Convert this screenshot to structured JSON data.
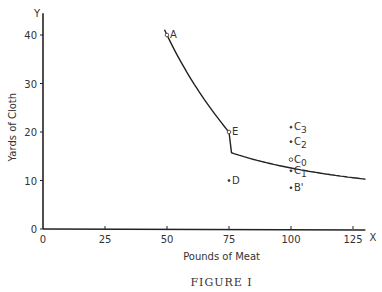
{
  "chart_data": {
    "type": "line",
    "title": "",
    "caption": "FIGURE I",
    "xlabel": "Pounds of Meat",
    "ylabel": "Yards of Cloth",
    "x_axis_letter": "X",
    "y_axis_letter": "Y",
    "xlim": [
      0,
      130
    ],
    "ylim": [
      0,
      44
    ],
    "x_ticks": [
      0,
      25,
      50,
      75,
      100,
      125
    ],
    "y_ticks": [
      0,
      10,
      20,
      30,
      40
    ],
    "grid": false,
    "series": [
      {
        "name": "indifference curve",
        "x": [
          49,
          50,
          60,
          75,
          90,
          100,
          115,
          130
        ],
        "y": [
          43.5,
          40,
          29,
          20,
          16,
          14.3,
          12.8,
          11.8
        ]
      }
    ],
    "points": [
      {
        "label": "A",
        "x": 50,
        "y": 40
      },
      {
        "label": "E",
        "x": 75,
        "y": 20
      },
      {
        "label": "C3",
        "x": 100,
        "y": 21
      },
      {
        "label": "C2",
        "x": 100,
        "y": 18
      },
      {
        "label": "C0",
        "x": 100,
        "y": 14.3
      },
      {
        "label": "C1",
        "x": 100,
        "y": 12
      },
      {
        "label": "D",
        "x": 75,
        "y": 10
      },
      {
        "label": "B'",
        "x": 100,
        "y": 8.5
      }
    ]
  }
}
